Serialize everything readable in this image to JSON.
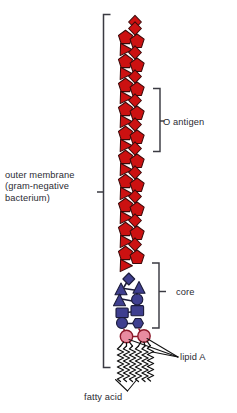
{
  "diagram": {
    "labels": {
      "outer_membrane_line1": "outer membrane",
      "outer_membrane_line2": "(gram-negative",
      "outer_membrane_line3": "bacterium)",
      "o_antigen": "O antigen",
      "core": "core",
      "lipid_a": "lipid A",
      "fatty_acid": "fatty acid"
    },
    "colors": {
      "o_antigen_fill": "#cc1111",
      "o_antigen_stroke": "#3a0a0a",
      "core_fill": "#3f3f8f",
      "core_stroke": "#1b1b3a",
      "lipid_a_fill": "#e88ca0",
      "lipid_a_stroke": "#8c1a2a",
      "bracket": "#3a3a42",
      "text": "#2b2b33",
      "background": "#ffffff",
      "chain": "#111111"
    },
    "regions": [
      {
        "name": "O antigen",
        "description": "repeating red sugar units: diamond, pentagon, pentagon, triangle"
      },
      {
        "name": "core",
        "description": "blue/navy oligosaccharide: diamonds, triangles, circles, squares, hexagons"
      },
      {
        "name": "lipid A",
        "description": "two pink glucosamine circles bearing six fatty acid chains"
      }
    ],
    "o_antigen_repeat_units": 10,
    "fatty_acid_chain_count": 6,
    "lipid_a_sugar_count": 2
  }
}
